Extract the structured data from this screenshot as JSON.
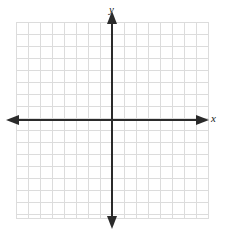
{
  "figure": {
    "title": "",
    "width": 225,
    "height": 236,
    "background_color": "#ffffff"
  },
  "labels": {
    "y_axis": "y",
    "x_axis": "x"
  },
  "style": {
    "grid_color": "#dcdcdc",
    "grid_minor_color": "#ebebeb",
    "axis_color": "#2b2b2b",
    "label_color": "#1a1a1a",
    "axis_width": 2,
    "grid_width": 1
  },
  "chart_data": {
    "type": "scatter",
    "title": "",
    "xlabel": "x",
    "ylabel": "y",
    "series": [
      {
        "name": "",
        "x": [],
        "y": []
      }
    ],
    "xlim": [
      -8,
      8
    ],
    "ylim": [
      -8,
      8
    ],
    "xticks": [
      -8,
      -7,
      -6,
      -5,
      -4,
      -3,
      -2,
      -1,
      0,
      1,
      2,
      3,
      4,
      5,
      6,
      7,
      8
    ],
    "yticks": [
      -8,
      -7,
      -6,
      -5,
      -4,
      -3,
      -2,
      -1,
      0,
      1,
      2,
      3,
      4,
      5,
      6,
      7,
      8
    ],
    "xtick_labels": [],
    "ytick_labels": [],
    "grid": true,
    "grid_columns": 16,
    "grid_rows": 16,
    "legend": null,
    "legend_position": "none",
    "annotations": [],
    "axes_have_arrows": true,
    "arrow_directions": [
      "up",
      "down",
      "left",
      "right"
    ],
    "origin_px": [
      112,
      120
    ],
    "grid_bounds_px": {
      "left": 16,
      "top": 22,
      "right": 208,
      "bottom": 218
    },
    "cell_size_px": 12
  }
}
